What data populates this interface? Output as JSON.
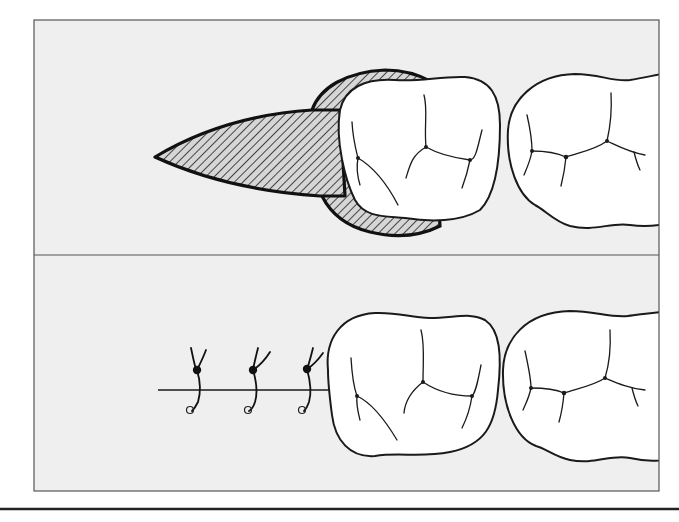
{
  "figure": {
    "colors": {
      "panel_background": "#efefef",
      "frame": "#555555",
      "tooth_fill": "#ffffff",
      "outline": "#1a1a1a",
      "hatch": "#444444"
    },
    "panels": [
      {
        "id": "top",
        "label": "",
        "elements": [
          "hatched-wedge-flap",
          "hatched-cuff-around-molar",
          "molar-1",
          "molar-2"
        ]
      },
      {
        "id": "bottom",
        "label": "",
        "elements": [
          "incision-line",
          "interrupted-suture-1",
          "interrupted-suture-2",
          "interrupted-suture-3",
          "molar-1",
          "molar-2"
        ]
      }
    ],
    "suture_count": 3
  }
}
